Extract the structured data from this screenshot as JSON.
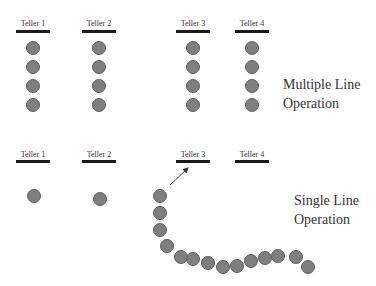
{
  "multiple_line": {
    "caption_line1": "Multiple Line",
    "caption_line2": "Operation",
    "tellers": [
      {
        "label": "Teller 1",
        "x": 33,
        "customers": 4
      },
      {
        "label": "Teller 2",
        "x": 99,
        "customers": 4
      },
      {
        "label": "Teller 3",
        "x": 193,
        "customers": 4
      },
      {
        "label": "Teller 4",
        "x": 252,
        "customers": 4
      }
    ]
  },
  "single_line": {
    "caption_line1": "Single Line",
    "caption_line2": "Operation",
    "tellers": [
      {
        "label": "Teller 1",
        "x": 33
      },
      {
        "label": "Teller 2",
        "x": 99
      },
      {
        "label": "Teller 3",
        "x": 193
      },
      {
        "label": "Teller 4",
        "x": 252
      }
    ],
    "arrow": {
      "from": [
        170,
        185
      ],
      "to": [
        188,
        168
      ]
    },
    "served_customers": [
      [
        34,
        196
      ],
      [
        100,
        199
      ]
    ],
    "queue": [
      [
        160,
        196
      ],
      [
        160,
        213
      ],
      [
        160,
        230
      ],
      [
        167,
        246
      ],
      [
        181,
        257
      ],
      [
        193,
        259
      ],
      [
        208,
        263
      ],
      [
        223,
        267
      ],
      [
        237,
        266
      ],
      [
        251,
        261
      ],
      [
        265,
        258
      ],
      [
        278,
        256
      ],
      [
        296,
        257
      ],
      [
        308,
        267
      ]
    ]
  },
  "colors": {
    "circle_fill": "#7f7f7f",
    "circle_stroke": "#5e5e5e",
    "bar": "#1a1a1a"
  }
}
